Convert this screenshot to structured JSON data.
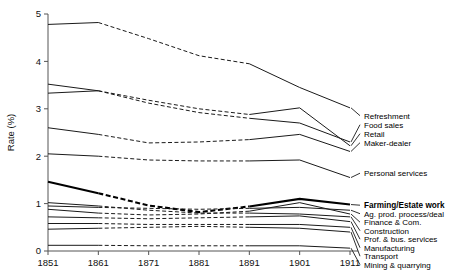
{
  "chart_data": {
    "type": "line",
    "title": "",
    "xlabel": "",
    "ylabel": "Rate (%)",
    "x": [
      1851,
      1861,
      1871,
      1881,
      1891,
      1901,
      1911
    ],
    "xlim": [
      1851,
      1911
    ],
    "ylim": [
      0,
      5
    ],
    "yticks": [
      0,
      1,
      2,
      3,
      4,
      5
    ],
    "xticks": [
      "1851",
      "1861",
      "1871",
      "1881",
      "1891",
      "1901",
      "1911"
    ],
    "grid": false,
    "legend_position": "right-inline-labels",
    "dash_note": "segments between 1861 and 1891 are drawn dashed (interpolated); 1851-1861 and 1891-1911 solid",
    "series": [
      {
        "name": "Refreshment",
        "values": [
          4.78,
          4.82,
          4.48,
          4.12,
          3.95,
          3.45,
          3.02
        ],
        "bold": false
      },
      {
        "name": "Food sales",
        "values": [
          3.52,
          3.38,
          3.12,
          2.92,
          2.8,
          2.7,
          2.3
        ],
        "bold": false
      },
      {
        "name": "Retail",
        "values": [
          3.33,
          3.38,
          3.18,
          3.0,
          2.88,
          3.02,
          2.22
        ],
        "bold": false
      },
      {
        "name": "Maker-dealer",
        "values": [
          2.6,
          2.46,
          2.28,
          2.3,
          2.35,
          2.46,
          2.1
        ],
        "bold": false
      },
      {
        "name": "Personal services",
        "values": [
          2.05,
          2.0,
          1.92,
          1.9,
          1.9,
          1.92,
          1.55
        ],
        "bold": false
      },
      {
        "name": "Farming/Estate work",
        "values": [
          1.46,
          1.22,
          0.96,
          0.82,
          0.94,
          1.1,
          0.98
        ],
        "bold": true
      },
      {
        "name": "Ag. prod. process/deal",
        "values": [
          0.95,
          0.92,
          0.9,
          0.88,
          0.9,
          0.92,
          0.86
        ],
        "bold": false
      },
      {
        "name": "Finance & Com.",
        "values": [
          0.88,
          0.8,
          0.76,
          0.78,
          0.84,
          1.02,
          0.78
        ],
        "bold": false
      },
      {
        "name": "Construction",
        "values": [
          1.02,
          0.95,
          0.86,
          0.8,
          0.8,
          0.78,
          0.72
        ],
        "bold": false
      },
      {
        "name": "Prof. & bus. services",
        "values": [
          0.72,
          0.7,
          0.68,
          0.7,
          0.72,
          0.74,
          0.62
        ],
        "bold": false
      },
      {
        "name": "Manufacturing",
        "values": [
          0.58,
          0.58,
          0.56,
          0.56,
          0.56,
          0.56,
          0.5
        ],
        "bold": false
      },
      {
        "name": "Transport",
        "values": [
          0.46,
          0.48,
          0.5,
          0.52,
          0.5,
          0.48,
          0.4
        ],
        "bold": false
      },
      {
        "name": "Mining & quarrying",
        "values": [
          0.12,
          0.12,
          0.11,
          0.11,
          0.11,
          0.11,
          0.06
        ],
        "bold": false
      }
    ]
  },
  "labels": {
    "refreshment": "Refreshment",
    "food_sales": "Food sales",
    "retail": "Retail",
    "maker_dealer": "Maker-dealer",
    "personal_services": "Personal services",
    "farming": "Farming/Estate work",
    "ag_prod": "Ag. prod. process/deal",
    "finance": "Finance & Com.",
    "construction": "Construction",
    "prof_bus": "Prof. & bus. services",
    "manufacturing": "Manufacturing",
    "transport": "Transport",
    "mining": "Mining & quarrying"
  }
}
